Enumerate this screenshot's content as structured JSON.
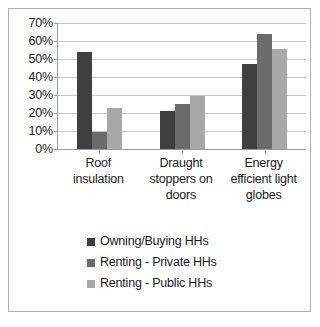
{
  "chart_data": {
    "type": "bar",
    "title": "",
    "subtitle": "",
    "xlabel": "",
    "ylabel": "",
    "grid": true,
    "legend_position": "bottom",
    "ylim": [
      0,
      70
    ],
    "ytick_step": 10,
    "ytick_labels": [
      "70%",
      "60%",
      "50%",
      "40%",
      "30%",
      "20%",
      "10%",
      "0%"
    ],
    "ytick_values": [
      70,
      60,
      50,
      40,
      30,
      20,
      10,
      0
    ],
    "categories": [
      "Roof insulation",
      "Draught stoppers on doors",
      "Energy efficient light globes"
    ],
    "category_lines": [
      [
        "Roof",
        "insulation"
      ],
      [
        "Draught",
        "stoppers on",
        "doors"
      ],
      [
        "Energy",
        "efficient light",
        "globes"
      ]
    ],
    "series": [
      {
        "name": "Owning/Buying HHs",
        "color": "#3f3f3f",
        "values": [
          54,
          21,
          47
        ]
      },
      {
        "name": "Renting - Private HHs",
        "color": "#6b6b6b",
        "values": [
          9.5,
          25,
          64
        ]
      },
      {
        "name": "Renting - Public HHs",
        "color": "#a8a8a8",
        "values": [
          23,
          29.5,
          55.5
        ]
      }
    ]
  },
  "colors": {
    "series_dark": "#3f3f3f",
    "series_medium": "#6b6b6b",
    "series_light": "#a8a8a8",
    "axis": "#9a9a9a",
    "gridline": "#c8c8c8",
    "border": "#b0b0b0",
    "text": "#1a1a1a",
    "background": "#ffffff"
  }
}
